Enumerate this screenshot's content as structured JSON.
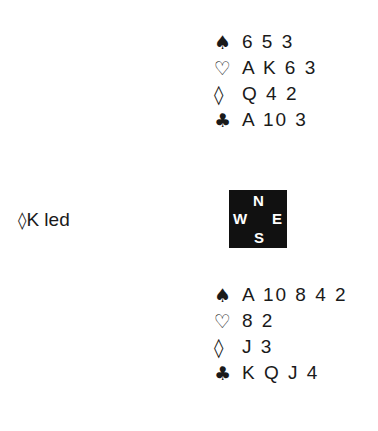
{
  "north": {
    "spades": {
      "symbol": "♠",
      "cards": "6 5 3"
    },
    "hearts": {
      "symbol": "♡",
      "cards": "A K 6 3"
    },
    "diamonds": {
      "symbol": "◊",
      "cards": "Q 4 2"
    },
    "clubs": {
      "symbol": "♣",
      "cards": "A 10 3"
    }
  },
  "south": {
    "spades": {
      "symbol": "♠",
      "cards": "A 10 8 4 2"
    },
    "hearts": {
      "symbol": "♡",
      "cards": "8 2"
    },
    "diamonds": {
      "symbol": "◊",
      "cards": "J 3"
    },
    "clubs": {
      "symbol": "♣",
      "cards": "K Q J 4"
    }
  },
  "lead": {
    "symbol": "◊",
    "text": "K led"
  },
  "compass": {
    "n": "N",
    "s": "S",
    "e": "E",
    "w": "W"
  }
}
